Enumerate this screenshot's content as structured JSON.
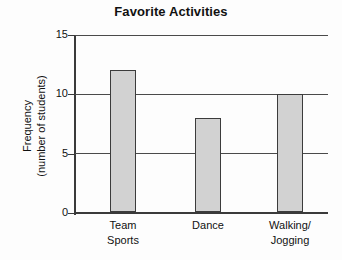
{
  "chart_data": {
    "type": "bar",
    "title": "Favorite Activities",
    "categories": [
      "Team Sports",
      "Dance",
      "Walking/ Jogging"
    ],
    "category_lines": [
      [
        "Team",
        "Sports"
      ],
      [
        "Dance",
        ""
      ],
      [
        "Walking/",
        "Jogging"
      ]
    ],
    "values": [
      12,
      8,
      10
    ],
    "xlabel": "",
    "ylabel": "Frequency (number of students)",
    "ylabel_lines": [
      "Frequency",
      "(number of students)"
    ],
    "ylim": [
      0,
      15
    ],
    "yticks": [
      0,
      5,
      10,
      15
    ],
    "ytick_labels": [
      "0",
      "5",
      "10",
      "15"
    ],
    "grid": true,
    "legend": false,
    "bar_color": "#d2d2d2",
    "bar_edge_color": "#3c3c3c",
    "axis_color": "#3a3a3a",
    "grid_color": "#4a4a4a",
    "background_color": "#fdfdfd",
    "text_color": "#111111"
  }
}
